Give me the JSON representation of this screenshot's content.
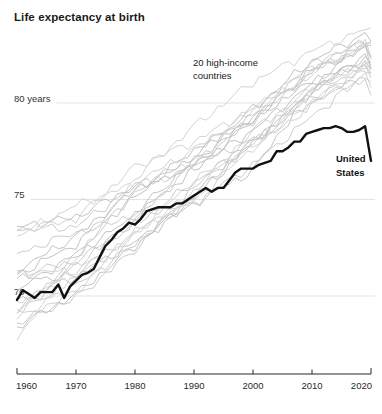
{
  "title": "Life expectancy at birth",
  "annotations": {
    "countries_label_line1": "20 high-income",
    "countries_label_line2": "countries",
    "us_label_line1": "United",
    "us_label_line2": "States"
  },
  "colors": {
    "us_line": "#111111",
    "country_lines": [
      "#c3c3c3",
      "#cccccc",
      "#d3d3d3"
    ],
    "gridline": "#e3e3e3",
    "axis": "#2b2b2b",
    "label_text": "#333333"
  },
  "chart_data": {
    "type": "line",
    "title": "Life expectancy at birth",
    "y_unit": "years",
    "x_range": [
      1960,
      2020
    ],
    "x_ticks": [
      1960,
      1970,
      1980,
      1990,
      2000,
      2010,
      2020
    ],
    "y_gridlines": [
      {
        "value": 80,
        "label": "80 years"
      },
      {
        "value": 75,
        "label": "75"
      },
      {
        "value": 70,
        "label": "70"
      }
    ],
    "grid": "horizontal-only",
    "legend": "inline-annotations",
    "series": {
      "united_states": {
        "name": "United States",
        "start_year": 1960,
        "values": [
          69.8,
          70.3,
          70.1,
          69.9,
          70.2,
          70.2,
          70.2,
          70.6,
          69.9,
          70.5,
          70.8,
          71.1,
          71.2,
          71.4,
          72.0,
          72.6,
          72.9,
          73.3,
          73.5,
          73.8,
          73.7,
          74.0,
          74.4,
          74.5,
          74.6,
          74.6,
          74.6,
          74.8,
          74.8,
          75.0,
          75.2,
          75.4,
          75.6,
          75.4,
          75.6,
          75.6,
          76.0,
          76.4,
          76.6,
          76.6,
          76.6,
          76.8,
          76.9,
          77.0,
          77.5,
          77.5,
          77.7,
          78.0,
          78.0,
          78.4,
          78.5,
          78.6,
          78.7,
          78.7,
          78.8,
          78.7,
          78.5,
          78.5,
          78.6,
          78.8,
          77.0
        ]
      },
      "high_income_countries": {
        "label": "20 high-income countries",
        "anchor_years": [
          1960,
          1970,
          1980,
          1990,
          2000,
          2010,
          2019,
          2020
        ],
        "countries": [
          {
            "name": "Australia",
            "values": [
              70.9,
              71.0,
              74.3,
              77.0,
              79.2,
              81.7,
              82.9,
              83.0
            ]
          },
          {
            "name": "Austria",
            "values": [
              68.6,
              69.9,
              72.4,
              75.6,
              78.1,
              80.6,
              81.8,
              81.3
            ]
          },
          {
            "name": "Belgium",
            "values": [
              69.7,
              70.9,
              73.2,
              76.0,
              77.7,
              80.1,
              81.8,
              80.8
            ]
          },
          {
            "name": "Canada",
            "values": [
              71.1,
              72.7,
              75.1,
              77.6,
              79.2,
              81.1,
              82.2,
              81.7
            ]
          },
          {
            "name": "Denmark",
            "values": [
              72.2,
              73.3,
              74.2,
              74.8,
              76.8,
              79.3,
              81.5,
              81.6
            ]
          },
          {
            "name": "Finland",
            "values": [
              68.8,
              70.2,
              73.4,
              74.9,
              77.7,
              79.9,
              81.9,
              82.0
            ]
          },
          {
            "name": "France",
            "values": [
              70.3,
              72.2,
              74.1,
              76.6,
              79.1,
              81.7,
              82.8,
              82.3
            ]
          },
          {
            "name": "Germany",
            "values": [
              69.3,
              70.5,
              72.7,
              75.2,
              78.1,
              80.0,
              81.3,
              81.1
            ]
          },
          {
            "name": "Iceland",
            "values": [
              73.4,
              74.0,
              76.7,
              78.0,
              79.7,
              81.9,
              83.2,
              83.1
            ]
          },
          {
            "name": "Ireland",
            "values": [
              69.8,
              71.0,
              72.8,
              74.8,
              76.5,
              80.8,
              82.3,
              82.1
            ]
          },
          {
            "name": "Italy",
            "values": [
              69.1,
              71.6,
              73.9,
              76.9,
              79.5,
              82.0,
              83.2,
              82.3
            ]
          },
          {
            "name": "Japan",
            "values": [
              67.7,
              71.9,
              76.1,
              78.8,
              81.1,
              82.7,
              83.8,
              83.9
            ]
          },
          {
            "name": "Luxembourg",
            "values": [
              68.4,
              70.1,
              72.6,
              75.1,
              77.9,
              80.6,
              82.4,
              81.8
            ]
          },
          {
            "name": "Netherlands",
            "values": [
              73.4,
              73.6,
              75.7,
              76.9,
              78.0,
              80.7,
              82.1,
              81.5
            ]
          },
          {
            "name": "New Zealand",
            "values": [
              71.2,
              71.3,
              73.2,
              75.4,
              78.6,
              80.7,
              82.0,
              82.1
            ]
          },
          {
            "name": "Norway",
            "values": [
              73.6,
              74.1,
              75.7,
              76.6,
              78.6,
              81.0,
              83.0,
              83.2
            ]
          },
          {
            "name": "Spain",
            "values": [
              69.1,
              72.0,
              75.4,
              76.8,
              79.1,
              81.6,
              83.2,
              81.8
            ]
          },
          {
            "name": "Sweden",
            "values": [
              73.1,
              74.7,
              75.8,
              77.6,
              79.6,
              81.5,
              83.1,
              82.4
            ]
          },
          {
            "name": "Switzerland",
            "values": [
              71.3,
              73.1,
              75.5,
              77.2,
              79.7,
              82.2,
              83.6,
              83.2
            ]
          },
          {
            "name": "United Kingdom",
            "values": [
              71.1,
              71.8,
              73.7,
              75.9,
              77.9,
              80.4,
              81.3,
              80.4
            ]
          }
        ]
      }
    }
  }
}
